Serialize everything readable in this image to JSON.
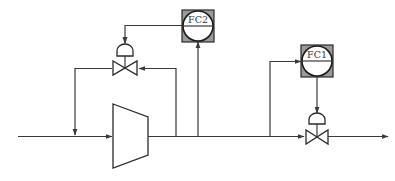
{
  "diagram": {
    "type": "process-flow-diagram",
    "title": "",
    "colors": {
      "line": "#3a3a3a",
      "instrument_box": "#9a9a9a",
      "background": "#ffffff"
    },
    "instruments": [
      {
        "id": "fc2",
        "label": "FC2",
        "kind": "flow-controller",
        "role": "recycle / anti-surge flow control"
      },
      {
        "id": "fc1",
        "label": "FC1",
        "kind": "flow-controller",
        "role": "discharge flow control"
      }
    ],
    "equipment": [
      {
        "id": "compressor",
        "kind": "compressor",
        "label": ""
      },
      {
        "id": "recycle-valve",
        "kind": "control-valve",
        "actuator": "diaphragm",
        "controlled_by": "FC2"
      },
      {
        "id": "discharge-valve",
        "kind": "control-valve",
        "actuator": "diaphragm",
        "controlled_by": "FC1"
      }
    ],
    "streams": [
      {
        "id": "inlet",
        "from": "left-edge",
        "to": "compressor"
      },
      {
        "id": "discharge",
        "from": "compressor",
        "to": "discharge-valve"
      },
      {
        "id": "outlet",
        "from": "discharge-valve",
        "to": "right-edge"
      },
      {
        "id": "recycle",
        "from": "compressor-discharge",
        "to": "compressor-inlet",
        "via": "recycle-valve"
      }
    ],
    "signals": [
      {
        "from": "discharge-line",
        "to": "FC2"
      },
      {
        "from": "FC2",
        "to": "recycle-valve"
      },
      {
        "from": "discharge-line",
        "to": "FC1"
      },
      {
        "from": "FC1",
        "to": "discharge-valve"
      }
    ]
  }
}
